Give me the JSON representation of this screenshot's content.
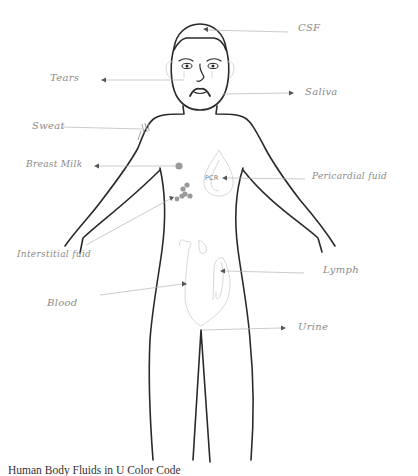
{
  "diagram": {
    "title_caption": "Human Body Fluids in U Color Code",
    "colors": {
      "outline": "#2a2a2a",
      "organ_sketch": "#d2d2d2",
      "leader_line": "#b4b4b4",
      "label_text": "#8a8a8a",
      "cell_dots": "#9a9a9a"
    },
    "labels": {
      "csf": "CSF",
      "tears": "Tears",
      "saliva": "Saliva",
      "sweat": "Sweat",
      "breast_milk": "Breast Milk",
      "pericardial_fluid": "Pericardial fuid",
      "pcr": "PCR",
      "interstitial_fluid": "Interstitial fuid",
      "lymph": "Lymph",
      "blood": "Blood",
      "urine": "Urine"
    }
  }
}
